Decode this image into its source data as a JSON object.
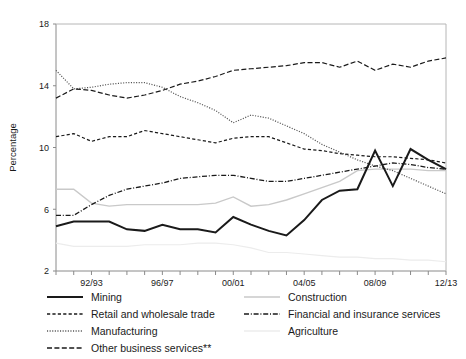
{
  "figure": {
    "ylabel": "Percentage"
  },
  "chart_data": {
    "type": "line",
    "title": "",
    "xlabel": "",
    "ylabel": "Percentage",
    "ylim": [
      2,
      18
    ],
    "yticks": [
      2,
      6,
      10,
      14,
      18
    ],
    "grid": false,
    "legend_position": "below-plot-two-columns",
    "x": [
      "90/91",
      "91/92",
      "92/93",
      "93/94",
      "94/95",
      "95/96",
      "96/97",
      "97/98",
      "98/99",
      "99/00",
      "00/01",
      "01/02",
      "02/03",
      "03/04",
      "04/05",
      "05/06",
      "06/07",
      "07/08",
      "08/09",
      "09/10",
      "10/11",
      "11/12",
      "12/13"
    ],
    "xtick_labels": [
      "92/93",
      "96/97",
      "00/01",
      "04/05",
      "08/09",
      "12/13"
    ],
    "xtick_positions": [
      "92/93",
      "96/97",
      "00/01",
      "04/05",
      "08/09",
      "12/13"
    ],
    "series": [
      {
        "name": "Mining",
        "style": "solid",
        "color": "#1a1a1a",
        "width": 2.0,
        "values": [
          4.9,
          5.2,
          5.2,
          5.2,
          4.7,
          4.6,
          5.0,
          4.7,
          4.7,
          4.5,
          5.5,
          5.0,
          4.6,
          4.3,
          5.3,
          6.6,
          7.2,
          7.3,
          9.8,
          7.5,
          9.9,
          9.2,
          8.6
        ]
      },
      {
        "name": "Retail and wholesale trade",
        "style": "dashed",
        "color": "#1a1a1a",
        "width": 1.2,
        "values": [
          10.7,
          10.9,
          10.4,
          10.7,
          10.7,
          11.1,
          10.9,
          10.7,
          10.5,
          10.3,
          10.6,
          10.7,
          10.7,
          10.3,
          9.9,
          9.8,
          9.6,
          9.5,
          9.4,
          9.4,
          9.3,
          9.2,
          9.0
        ]
      },
      {
        "name": "Manufacturing",
        "style": "dotted",
        "color": "#555555",
        "width": 1.2,
        "values": [
          15.0,
          13.8,
          13.9,
          14.1,
          14.2,
          14.2,
          13.9,
          13.3,
          12.9,
          12.4,
          11.6,
          12.1,
          11.9,
          11.4,
          10.9,
          10.2,
          9.7,
          9.2,
          8.8,
          8.5,
          8.0,
          7.5,
          7.0
        ]
      },
      {
        "name": "Other business services**",
        "style": "dashed-long",
        "color": "#1a1a1a",
        "width": 1.2,
        "values": [
          13.2,
          13.8,
          13.7,
          13.4,
          13.2,
          13.4,
          13.7,
          14.1,
          14.3,
          14.6,
          15.0,
          15.1,
          15.2,
          15.3,
          15.5,
          15.5,
          15.2,
          15.6,
          15.0,
          15.4,
          15.2,
          15.6,
          15.8
        ]
      },
      {
        "name": "Construction",
        "style": "solid",
        "color": "#c9c9c9",
        "width": 1.4,
        "values": [
          7.3,
          7.3,
          6.4,
          6.2,
          6.3,
          6.3,
          6.3,
          6.3,
          6.3,
          6.4,
          6.8,
          6.2,
          6.3,
          6.6,
          7.0,
          7.4,
          7.8,
          8.5,
          8.6,
          8.6,
          8.6,
          8.5,
          8.5
        ]
      },
      {
        "name": "Financial and insurance services",
        "style": "dashdot",
        "color": "#1a1a1a",
        "width": 1.3,
        "values": [
          5.6,
          5.6,
          6.3,
          6.9,
          7.3,
          7.5,
          7.7,
          8.0,
          8.1,
          8.2,
          8.2,
          8.0,
          7.8,
          7.8,
          8.0,
          8.2,
          8.4,
          8.6,
          8.8,
          9.0,
          8.9,
          8.7,
          8.6
        ]
      },
      {
        "name": "Agriculture",
        "style": "solid",
        "color": "#ececec",
        "width": 1.2,
        "values": [
          3.8,
          3.6,
          3.6,
          3.6,
          3.6,
          3.7,
          3.7,
          3.7,
          3.8,
          3.8,
          3.7,
          3.5,
          3.2,
          3.2,
          3.1,
          3.0,
          2.9,
          2.9,
          2.8,
          2.8,
          2.7,
          2.7,
          2.6
        ]
      }
    ]
  },
  "legend": {
    "left_column": [
      {
        "label": "Mining",
        "style": "solid",
        "color": "#1a1a1a",
        "width": 2.0
      },
      {
        "label": "Retail and wholesale trade",
        "style": "dashed",
        "color": "#1a1a1a",
        "width": 1.3
      },
      {
        "label": "Manufacturing",
        "style": "dotted",
        "color": "#555555",
        "width": 1.3
      },
      {
        "label": "Other business services**",
        "style": "dashed-long",
        "color": "#1a1a1a",
        "width": 1.3
      }
    ],
    "right_column": [
      {
        "label": "Construction",
        "style": "solid",
        "color": "#c9c9c9",
        "width": 1.5
      },
      {
        "label": "Financial and insurance services",
        "style": "dashdot",
        "color": "#1a1a1a",
        "width": 1.4
      },
      {
        "label": "Agriculture",
        "style": "solid",
        "color": "#ececec",
        "width": 1.5
      }
    ]
  }
}
